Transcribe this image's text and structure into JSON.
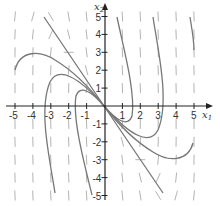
{
  "figure": {
    "type": "phase-portrait",
    "x_axis_label": "x",
    "x_axis_sub": "1",
    "y_axis_label": "x",
    "y_axis_sub": "2",
    "x_ticks": [
      "-5",
      "-4",
      "-3",
      "-2",
      "-1",
      "1",
      "2",
      "3",
      "4",
      "5"
    ],
    "y_ticks": [
      "5",
      "4",
      "3",
      "2",
      "1",
      "-1",
      "-2",
      "-3",
      "-4",
      "-5"
    ],
    "colors": {
      "axis": "#222222",
      "trajectory": "#777777",
      "direction_field": "#aaaaaa"
    }
  },
  "chart_data": {
    "type": "line",
    "title": "",
    "xlabel": "x1",
    "ylabel": "x2",
    "xlim": [
      -5,
      5
    ],
    "ylim": [
      -5,
      5
    ],
    "grid": false,
    "x_ticks": [
      -5,
      -4,
      -3,
      -2,
      -1,
      1,
      2,
      3,
      4,
      5
    ],
    "y_ticks": [
      -5,
      -4,
      -3,
      -2,
      -1,
      1,
      2,
      3,
      4,
      5
    ],
    "series": [
      {
        "name": "eigenline",
        "points": [
          [
            -3.4,
            5
          ],
          [
            0,
            0
          ],
          [
            3.3,
            -4.9
          ]
        ]
      },
      {
        "name": "trajectory-A",
        "points": [
          [
            -5,
            2
          ],
          [
            -3.9,
            2.9
          ],
          [
            -2,
            2.2
          ],
          [
            0,
            0
          ]
        ]
      },
      {
        "name": "trajectory-B",
        "points": [
          [
            -2.8,
            -4.9
          ],
          [
            -3.4,
            0
          ],
          [
            -2.5,
            1.9
          ],
          [
            -1,
            1.3
          ],
          [
            0,
            0
          ]
        ]
      },
      {
        "name": "trajectory-C",
        "points": [
          [
            -0.7,
            -5
          ],
          [
            -1.6,
            0
          ],
          [
            -1.3,
            1
          ],
          [
            0,
            0
          ]
        ]
      },
      {
        "name": "trajectory-A-mirror",
        "points": [
          [
            5,
            -2
          ],
          [
            3.9,
            -2.9
          ],
          [
            2,
            -2.2
          ],
          [
            0,
            0
          ]
        ]
      },
      {
        "name": "trajectory-B-mirror",
        "points": [
          [
            2.8,
            4.9
          ],
          [
            3.4,
            0
          ],
          [
            2.5,
            -1.9
          ],
          [
            1,
            -1.3
          ],
          [
            0,
            0
          ]
        ]
      },
      {
        "name": "trajectory-C-mirror",
        "points": [
          [
            0.7,
            5
          ],
          [
            1.6,
            0
          ],
          [
            1.3,
            -1
          ],
          [
            0,
            0
          ]
        ]
      }
    ]
  }
}
